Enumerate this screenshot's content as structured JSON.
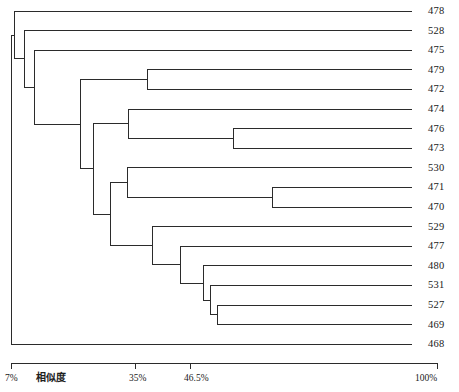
{
  "figure": {
    "type": "dendrogram",
    "orientation": "horizontal-right-leaves",
    "background": "#ffffff",
    "line_color": "#2b2b2b",
    "line_width": 1
  },
  "axis": {
    "name": "similarity-axis",
    "title": "相似度",
    "title_x": 36,
    "axis_y": 363,
    "tick_height": 6,
    "x_start": 11,
    "x_end": 437,
    "ticks": [
      {
        "label": "7%",
        "x": 11,
        "value": 7
      },
      {
        "label": "35%",
        "x": 135,
        "value": 35
      },
      {
        "label": "46.5%",
        "x": 190,
        "value": 46.5
      },
      {
        "label": "100%",
        "x": 437,
        "value": 100
      }
    ]
  },
  "leaves": [
    {
      "label": "478",
      "y": 11,
      "x_tip": 412
    },
    {
      "label": "528",
      "y": 30.6,
      "x_tip": 412
    },
    {
      "label": "475",
      "y": 50.2,
      "x_tip": 412
    },
    {
      "label": "479",
      "y": 69.8,
      "x_tip": 412
    },
    {
      "label": "472",
      "y": 89.4,
      "x_tip": 412
    },
    {
      "label": "474",
      "y": 109.0,
      "x_tip": 412
    },
    {
      "label": "476",
      "y": 128.6,
      "x_tip": 412
    },
    {
      "label": "473",
      "y": 148.2,
      "x_tip": 412
    },
    {
      "label": "530",
      "y": 167.8,
      "x_tip": 412
    },
    {
      "label": "471",
      "y": 187.4,
      "x_tip": 412
    },
    {
      "label": "470",
      "y": 207.0,
      "x_tip": 412
    },
    {
      "label": "529",
      "y": 226.6,
      "x_tip": 412
    },
    {
      "label": "477",
      "y": 246.2,
      "x_tip": 412
    },
    {
      "label": "480",
      "y": 265.8,
      "x_tip": 412
    },
    {
      "label": "531",
      "y": 285.4,
      "x_tip": 412
    },
    {
      "label": "527",
      "y": 305.0,
      "x_tip": 412
    },
    {
      "label": "469",
      "y": 324.6,
      "x_tip": 412
    },
    {
      "label": "468",
      "y": 344.2,
      "x_tip": 412
    }
  ],
  "label_x": 428,
  "chart_data": {
    "type": "dendrogram",
    "title": "",
    "xlabel": "相似度",
    "ylabel": "",
    "xlim": [
      7,
      100
    ],
    "leaf_order": [
      "478",
      "528",
      "475",
      "479",
      "472",
      "474",
      "476",
      "473",
      "530",
      "471",
      "470",
      "529",
      "477",
      "480",
      "531",
      "527",
      "469",
      "468"
    ],
    "merges": [
      {
        "id": "m_479_472",
        "x": 147,
        "similarity_pct": 37.7,
        "children_y": [
          69.8,
          89.4
        ],
        "y": 79.6
      },
      {
        "id": "m_476_473",
        "x": 233,
        "similarity_pct": 56.5,
        "children_y": [
          128.6,
          148.2
        ],
        "y": 138.4
      },
      {
        "id": "m_474_x",
        "x": 128,
        "similarity_pct": 33.5,
        "children_y": [
          109.0,
          138.4
        ],
        "y": 123.7
      },
      {
        "id": "m_471_470",
        "x": 272,
        "similarity_pct": 64.9,
        "children_y": [
          187.4,
          207.0
        ],
        "y": 197.2
      },
      {
        "id": "m_530_x",
        "x": 127,
        "similarity_pct": 33.3,
        "children_y": [
          167.8,
          197.2
        ],
        "y": 182.5
      },
      {
        "id": "m_527_469",
        "x": 217,
        "similarity_pct": 51.9,
        "children_y": [
          305.0,
          324.6
        ],
        "y": 314.8
      },
      {
        "id": "m_531_x",
        "x": 210,
        "similarity_pct": 50.4,
        "children_y": [
          285.4,
          314.8
        ],
        "y": 300.1
      },
      {
        "id": "m_480_x",
        "x": 203,
        "similarity_pct": 48.9,
        "children_y": [
          265.8,
          300.1
        ],
        "y": 283.0
      },
      {
        "id": "m_477_x",
        "x": 180,
        "similarity_pct": 43.9,
        "children_y": [
          246.2,
          283.0
        ],
        "y": 264.6
      },
      {
        "id": "m_529_x",
        "x": 152,
        "similarity_pct": 37.8,
        "children_y": [
          226.6,
          264.6
        ],
        "y": 245.6
      },
      {
        "id": "m_upper_mid",
        "x": 110,
        "similarity_pct": 29.4,
        "children_y": [
          182.5,
          245.6
        ],
        "y": 214.1
      },
      {
        "id": "m_474g_x",
        "x": 93,
        "similarity_pct": 25.7,
        "children_y": [
          123.7,
          214.1
        ],
        "y": 168.9
      },
      {
        "id": "m_479g_x",
        "x": 80,
        "similarity_pct": 22.9,
        "children_y": [
          79.6,
          168.9
        ],
        "y": 124.2
      },
      {
        "id": "m_475_x",
        "x": 34,
        "similarity_pct": 12.9,
        "children_y": [
          50.2,
          124.2
        ],
        "y": 87.2
      },
      {
        "id": "m_528_x",
        "x": 24,
        "similarity_pct": 10.7,
        "children_y": [
          30.6,
          87.2
        ],
        "y": 58.9
      },
      {
        "id": "m_478_x",
        "x": 14,
        "similarity_pct": 8.6,
        "children_y": [
          11.0,
          58.9
        ],
        "y": 35.0
      },
      {
        "id": "m_root",
        "x": 11,
        "similarity_pct": 7.0,
        "children_y": [
          35.0,
          344.2
        ],
        "y": 189.6
      }
    ],
    "n_leaves": 18
  }
}
